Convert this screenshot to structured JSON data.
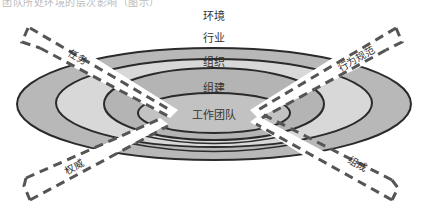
{
  "top_cutoff_text": "团队所处环境的层次影响（图示）",
  "diagram": {
    "layers": [
      {
        "label": "环境",
        "color": "#ffffff"
      },
      {
        "label": "行业",
        "color": "#b8b8b8"
      },
      {
        "label": "组织",
        "color": "#d8d8d8"
      },
      {
        "label": "组建",
        "color": "#b4b4b4"
      },
      {
        "label": "工作团队",
        "color": "#c2c2c2"
      }
    ],
    "arrows": [
      {
        "label": "任务",
        "position": "upper-left"
      },
      {
        "label": "行为规范",
        "position": "upper-right"
      },
      {
        "label": "权威",
        "position": "lower-left"
      },
      {
        "label": "组成",
        "position": "lower-right"
      }
    ],
    "colors": {
      "outline": "#2a2a2a",
      "dash": "#555555",
      "text": "#333333"
    }
  }
}
